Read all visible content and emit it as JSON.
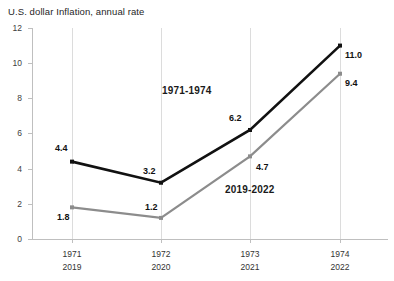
{
  "chart_data": {
    "type": "line",
    "title": "U.S. dollar Inflation, annual rate",
    "xlabel": "",
    "ylabel": "",
    "ylim": [
      0,
      12
    ],
    "yticks": [
      "0",
      "2",
      "4",
      "6",
      "8",
      "10",
      "12"
    ],
    "grid": "vertical-only",
    "legend": "inline-annotations",
    "categories": [
      "1971",
      "1972",
      "1973",
      "1974"
    ],
    "categories_secondary": [
      "2019",
      "2020",
      "2021",
      "2022"
    ],
    "series": [
      {
        "name": "1971-1974",
        "color": "#111111",
        "values": [
          4.4,
          3.2,
          6.2,
          11.0
        ],
        "labels": [
          "4.4",
          "3.2",
          "6.2",
          "11.0"
        ]
      },
      {
        "name": "2019-2022",
        "color": "#8c8c8c",
        "values": [
          1.8,
          1.2,
          4.7,
          9.4
        ],
        "labels": [
          "1.8",
          "1.2",
          "4.7",
          "9.4"
        ]
      }
    ],
    "annotations": [
      {
        "text": "1971-1974",
        "x": 162,
        "y": 94
      },
      {
        "text": "2019-2022",
        "x": 225,
        "y": 193
      }
    ]
  },
  "axis": {
    "y_ticks": [
      {
        "label": "12",
        "value": 12
      },
      {
        "label": "10",
        "value": 10
      },
      {
        "label": "8",
        "value": 8
      },
      {
        "label": "6",
        "value": 6
      },
      {
        "label": "4",
        "value": 4
      },
      {
        "label": "2",
        "value": 2
      },
      {
        "label": "0",
        "value": 0
      }
    ],
    "x_ticks": [
      {
        "top": "1971",
        "bottom": "2019"
      },
      {
        "top": "1972",
        "bottom": "2020"
      },
      {
        "top": "1973",
        "bottom": "2021"
      },
      {
        "top": "1974",
        "bottom": "2022"
      }
    ]
  },
  "colors": {
    "series_black": "#111111",
    "series_gray": "#8c8c8c",
    "axis": "#bfbfbf",
    "grid": "#dcdcdc",
    "text": "#1a1a1a",
    "background": "#ffffff"
  }
}
